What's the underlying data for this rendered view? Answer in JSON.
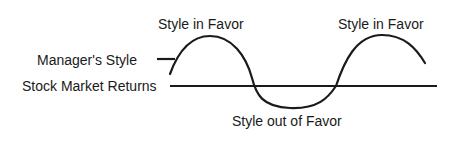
{
  "diagram": {
    "labels": {
      "style_in_favor_1": "Style in Favor",
      "style_in_favor_2": "Style in Favor",
      "managers_style": "Manager's Style",
      "stock_market_returns": "Stock Market Returns",
      "style_out_of_favor": "Style out of Favor"
    },
    "series": [
      {
        "name": "Manager's Style",
        "shape": "sine wave oscillating around the market baseline",
        "phases": [
          "rising",
          "in favor (above)",
          "out of favor (below)",
          "in favor (above)",
          "falling"
        ]
      },
      {
        "name": "Stock Market Returns",
        "shape": "flat horizontal baseline"
      }
    ],
    "colors": {
      "line": "#1a1a1a",
      "background": "#ffffff"
    }
  }
}
